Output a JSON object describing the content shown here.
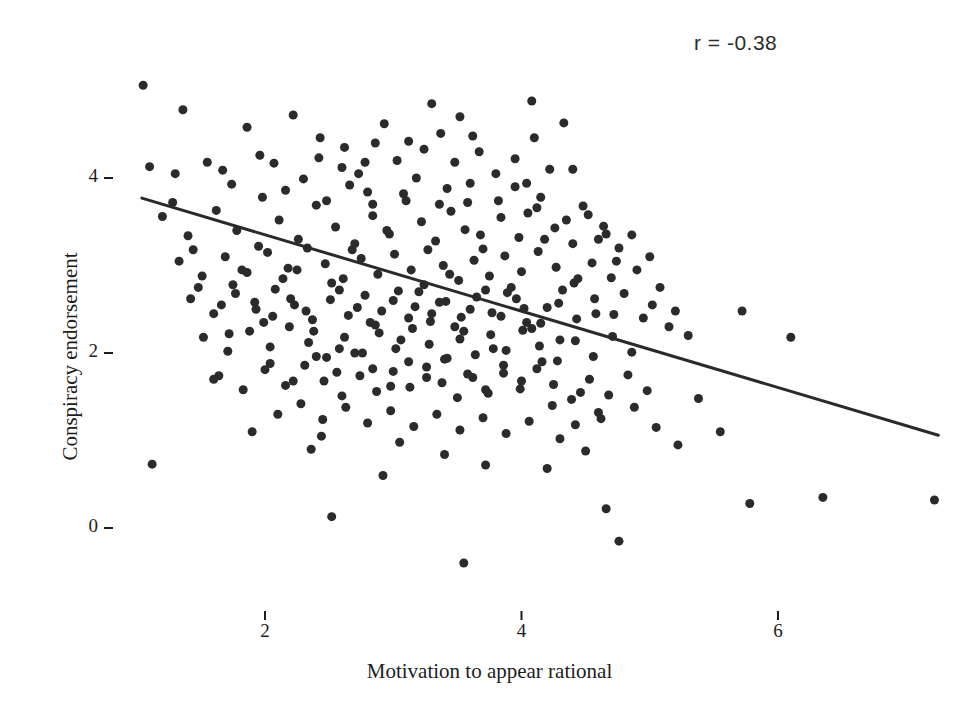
{
  "chart_data": {
    "type": "scatter",
    "title": "",
    "xlabel": "Motivation to appear rational",
    "ylabel": "Conspiracy endorsement",
    "annotation": "r =  -0.38",
    "correlation": -0.38,
    "grid": false,
    "legend": "none",
    "xlim": [
      0.75,
      7.35
    ],
    "ylim": [
      -0.75,
      5.25
    ],
    "xticks": [
      2,
      4,
      6
    ],
    "xtick_labels": [
      "2",
      "4",
      "6"
    ],
    "yticks": [
      0,
      2,
      4
    ],
    "ytick_labels": [
      "0",
      "2",
      "4"
    ],
    "marker": {
      "shape": "circle",
      "color": "#2b2b2b",
      "diameter_px": 9
    },
    "trendline": {
      "type": "linear-fit",
      "color": "#2a2a2a",
      "width_px": 3,
      "x_start": 1.04,
      "y_start": 3.77,
      "x_end": 7.25,
      "y_end": 1.06
    },
    "points": [
      [
        1.05,
        5.06
      ],
      [
        1.36,
        4.78
      ],
      [
        1.86,
        4.58
      ],
      [
        2.22,
        4.72
      ],
      [
        2.43,
        4.46
      ],
      [
        1.96,
        4.26
      ],
      [
        2.6,
        4.12
      ],
      [
        2.93,
        4.62
      ],
      [
        3.24,
        4.33
      ],
      [
        3.18,
        4.0
      ],
      [
        1.1,
        4.13
      ],
      [
        1.3,
        4.05
      ],
      [
        1.67,
        4.09
      ],
      [
        1.74,
        3.93
      ],
      [
        2.07,
        4.17
      ],
      [
        2.3,
        3.99
      ],
      [
        2.42,
        4.23
      ],
      [
        2.73,
        4.05
      ],
      [
        2.8,
        3.84
      ],
      [
        3.03,
        4.2
      ],
      [
        3.37,
        4.51
      ],
      [
        3.52,
        4.7
      ],
      [
        3.67,
        4.3
      ],
      [
        3.8,
        4.05
      ],
      [
        3.95,
        4.22
      ],
      [
        4.1,
        4.46
      ],
      [
        4.22,
        4.1
      ],
      [
        4.33,
        4.63
      ],
      [
        3.42,
        3.88
      ],
      [
        3.58,
        3.72
      ],
      [
        1.2,
        3.56
      ],
      [
        1.4,
        3.34
      ],
      [
        1.62,
        3.63
      ],
      [
        1.78,
        3.4
      ],
      [
        1.95,
        3.22
      ],
      [
        2.11,
        3.52
      ],
      [
        2.26,
        3.3
      ],
      [
        2.4,
        3.69
      ],
      [
        2.55,
        3.44
      ],
      [
        2.68,
        3.18
      ],
      [
        2.84,
        3.57
      ],
      [
        2.97,
        3.36
      ],
      [
        3.1,
        3.74
      ],
      [
        3.22,
        3.5
      ],
      [
        3.33,
        3.28
      ],
      [
        3.45,
        3.62
      ],
      [
        3.56,
        3.41
      ],
      [
        3.7,
        3.19
      ],
      [
        3.84,
        3.55
      ],
      [
        3.98,
        3.32
      ],
      [
        4.12,
        3.66
      ],
      [
        4.26,
        3.43
      ],
      [
        4.4,
        3.25
      ],
      [
        4.52,
        3.58
      ],
      [
        4.66,
        3.36
      ],
      [
        1.33,
        3.05
      ],
      [
        1.51,
        2.88
      ],
      [
        1.69,
        3.1
      ],
      [
        1.86,
        2.92
      ],
      [
        2.02,
        3.15
      ],
      [
        2.18,
        2.97
      ],
      [
        2.33,
        3.2
      ],
      [
        2.47,
        3.02
      ],
      [
        2.61,
        2.85
      ],
      [
        2.75,
        3.08
      ],
      [
        2.88,
        2.9
      ],
      [
        3.01,
        3.13
      ],
      [
        3.14,
        2.95
      ],
      [
        3.27,
        3.18
      ],
      [
        3.39,
        3.0
      ],
      [
        3.51,
        2.83
      ],
      [
        3.63,
        3.06
      ],
      [
        3.75,
        2.88
      ],
      [
        3.87,
        3.11
      ],
      [
        4.0,
        2.93
      ],
      [
        4.13,
        3.16
      ],
      [
        4.27,
        2.98
      ],
      [
        4.41,
        2.8
      ],
      [
        4.55,
        3.03
      ],
      [
        4.7,
        2.86
      ],
      [
        1.42,
        2.62
      ],
      [
        1.6,
        2.45
      ],
      [
        1.77,
        2.68
      ],
      [
        1.93,
        2.5
      ],
      [
        2.08,
        2.73
      ],
      [
        2.23,
        2.55
      ],
      [
        2.37,
        2.38
      ],
      [
        2.51,
        2.61
      ],
      [
        2.65,
        2.43
      ],
      [
        2.78,
        2.66
      ],
      [
        2.91,
        2.48
      ],
      [
        3.04,
        2.71
      ],
      [
        3.17,
        2.53
      ],
      [
        3.29,
        2.36
      ],
      [
        3.41,
        2.59
      ],
      [
        3.53,
        2.41
      ],
      [
        3.65,
        2.64
      ],
      [
        3.77,
        2.46
      ],
      [
        3.89,
        2.69
      ],
      [
        4.02,
        2.51
      ],
      [
        4.15,
        2.34
      ],
      [
        4.29,
        2.57
      ],
      [
        4.43,
        2.39
      ],
      [
        4.57,
        2.62
      ],
      [
        4.72,
        2.44
      ],
      [
        1.52,
        2.18
      ],
      [
        1.71,
        2.02
      ],
      [
        1.88,
        2.25
      ],
      [
        2.04,
        2.07
      ],
      [
        2.19,
        2.3
      ],
      [
        2.34,
        2.12
      ],
      [
        2.48,
        1.95
      ],
      [
        2.62,
        2.18
      ],
      [
        2.76,
        2.0
      ],
      [
        2.89,
        2.23
      ],
      [
        3.02,
        2.05
      ],
      [
        3.15,
        2.28
      ],
      [
        3.28,
        2.1
      ],
      [
        3.4,
        1.93
      ],
      [
        3.52,
        2.16
      ],
      [
        3.64,
        1.98
      ],
      [
        3.76,
        2.21
      ],
      [
        3.88,
        2.03
      ],
      [
        4.01,
        2.26
      ],
      [
        4.14,
        2.08
      ],
      [
        4.28,
        1.91
      ],
      [
        4.42,
        2.14
      ],
      [
        4.56,
        1.96
      ],
      [
        4.71,
        2.19
      ],
      [
        4.86,
        2.01
      ],
      [
        1.64,
        1.74
      ],
      [
        1.83,
        1.58
      ],
      [
        2.0,
        1.81
      ],
      [
        2.16,
        1.63
      ],
      [
        2.31,
        1.86
      ],
      [
        2.46,
        1.68
      ],
      [
        2.6,
        1.51
      ],
      [
        2.74,
        1.74
      ],
      [
        2.87,
        1.56
      ],
      [
        3.0,
        1.79
      ],
      [
        3.13,
        1.61
      ],
      [
        3.26,
        1.84
      ],
      [
        3.38,
        1.66
      ],
      [
        3.5,
        1.49
      ],
      [
        3.62,
        1.72
      ],
      [
        3.74,
        1.54
      ],
      [
        3.86,
        1.77
      ],
      [
        3.99,
        1.59
      ],
      [
        4.12,
        1.82
      ],
      [
        4.25,
        1.64
      ],
      [
        4.39,
        1.47
      ],
      [
        4.53,
        1.7
      ],
      [
        4.68,
        1.52
      ],
      [
        4.83,
        1.75
      ],
      [
        4.98,
        1.57
      ],
      [
        2.1,
        1.3
      ],
      [
        2.28,
        1.42
      ],
      [
        2.45,
        1.24
      ],
      [
        2.63,
        1.38
      ],
      [
        2.8,
        1.2
      ],
      [
        2.98,
        1.34
      ],
      [
        3.16,
        1.16
      ],
      [
        3.34,
        1.3
      ],
      [
        3.52,
        1.12
      ],
      [
        3.7,
        1.26
      ],
      [
        3.88,
        1.08
      ],
      [
        4.06,
        1.22
      ],
      [
        4.24,
        1.4
      ],
      [
        4.42,
        1.18
      ],
      [
        4.6,
        1.32
      ],
      [
        2.25,
        2.95
      ],
      [
        2.52,
        2.8
      ],
      [
        2.7,
        3.25
      ],
      [
        2.95,
        3.4
      ],
      [
        3.2,
        2.7
      ],
      [
        3.44,
        2.9
      ],
      [
        3.68,
        3.35
      ],
      [
        3.92,
        2.75
      ],
      [
        4.18,
        3.3
      ],
      [
        4.44,
        2.85
      ],
      [
        2.38,
        2.25
      ],
      [
        2.58,
        2.05
      ],
      [
        2.82,
        2.35
      ],
      [
        3.06,
        2.15
      ],
      [
        3.3,
        2.45
      ],
      [
        3.55,
        2.25
      ],
      [
        3.78,
        2.05
      ],
      [
        4.04,
        2.35
      ],
      [
        4.3,
        2.15
      ],
      [
        4.58,
        2.45
      ],
      [
        1.48,
        2.75
      ],
      [
        1.66,
        2.55
      ],
      [
        1.82,
        2.95
      ],
      [
        1.99,
        2.35
      ],
      [
        2.14,
        2.85
      ],
      [
        4.76,
        3.2
      ],
      [
        4.9,
        2.95
      ],
      [
        5.02,
        2.55
      ],
      [
        5.15,
        2.3
      ],
      [
        4.64,
        3.45
      ],
      [
        4.8,
        2.68
      ],
      [
        4.95,
        2.4
      ],
      [
        5.08,
        2.75
      ],
      [
        5.2,
        2.48
      ],
      [
        5.3,
        2.2
      ],
      [
        1.9,
        1.1
      ],
      [
        2.36,
        0.9
      ],
      [
        3.05,
        0.98
      ],
      [
        3.4,
        0.84
      ],
      [
        2.52,
        0.13
      ],
      [
        3.55,
        -0.4
      ],
      [
        4.66,
        0.22
      ],
      [
        4.76,
        -0.15
      ],
      [
        4.5,
        0.88
      ],
      [
        4.3,
        1.02
      ],
      [
        1.12,
        0.73
      ],
      [
        2.44,
        1.05
      ],
      [
        4.88,
        1.38
      ],
      [
        5.05,
        1.15
      ],
      [
        5.22,
        0.95
      ],
      [
        5.38,
        1.48
      ],
      [
        5.55,
        1.1
      ],
      [
        5.78,
        0.28
      ],
      [
        6.35,
        0.35
      ],
      [
        7.22,
        0.32
      ],
      [
        5.72,
        2.48
      ],
      [
        6.1,
        2.18
      ],
      [
        4.08,
        4.88
      ],
      [
        3.3,
        4.85
      ],
      [
        2.86,
        4.4
      ],
      [
        1.55,
        4.18
      ],
      [
        1.28,
        3.72
      ],
      [
        1.44,
        3.18
      ],
      [
        1.72,
        2.22
      ],
      [
        1.6,
        1.7
      ],
      [
        2.92,
        0.6
      ],
      [
        3.72,
        0.72
      ],
      [
        4.2,
        0.68
      ],
      [
        4.46,
        1.55
      ],
      [
        4.62,
        1.25
      ],
      [
        3.95,
        3.9
      ],
      [
        4.05,
        3.6
      ],
      [
        4.15,
        3.78
      ],
      [
        4.35,
        3.52
      ],
      [
        4.48,
        3.68
      ],
      [
        4.6,
        3.3
      ],
      [
        4.74,
        3.05
      ],
      [
        4.86,
        3.35
      ],
      [
        5.0,
        3.1
      ],
      [
        4.4,
        4.1
      ],
      [
        2.62,
        4.35
      ],
      [
        2.78,
        4.18
      ],
      [
        3.12,
        4.42
      ],
      [
        3.48,
        4.18
      ],
      [
        3.62,
        4.48
      ],
      [
        1.98,
        3.78
      ],
      [
        2.16,
        3.86
      ],
      [
        2.48,
        3.74
      ],
      [
        2.66,
        3.92
      ],
      [
        2.84,
        3.7
      ],
      [
        3.08,
        3.82
      ],
      [
        3.36,
        3.7
      ],
      [
        3.6,
        3.94
      ],
      [
        3.82,
        3.74
      ],
      [
        4.04,
        3.94
      ],
      [
        1.75,
        2.78
      ],
      [
        1.92,
        2.58
      ],
      [
        2.06,
        2.42
      ],
      [
        2.2,
        2.62
      ],
      [
        2.32,
        2.48
      ],
      [
        2.58,
        2.72
      ],
      [
        2.72,
        2.52
      ],
      [
        2.86,
        2.32
      ],
      [
        3.0,
        2.6
      ],
      [
        3.12,
        2.4
      ],
      [
        3.24,
        2.78
      ],
      [
        3.36,
        2.58
      ],
      [
        3.48,
        2.3
      ],
      [
        3.6,
        2.5
      ],
      [
        3.72,
        2.72
      ],
      [
        3.84,
        2.42
      ],
      [
        3.96,
        2.62
      ],
      [
        4.08,
        2.28
      ],
      [
        4.2,
        2.52
      ],
      [
        4.32,
        2.72
      ],
      [
        2.04,
        1.88
      ],
      [
        2.22,
        1.68
      ],
      [
        2.4,
        1.96
      ],
      [
        2.56,
        1.78
      ],
      [
        2.7,
        2.0
      ],
      [
        2.84,
        1.82
      ],
      [
        2.98,
        1.62
      ],
      [
        3.12,
        1.9
      ],
      [
        3.26,
        1.72
      ],
      [
        3.42,
        1.94
      ],
      [
        3.58,
        1.76
      ],
      [
        3.72,
        1.58
      ],
      [
        3.86,
        1.86
      ],
      [
        4.0,
        1.68
      ],
      [
        4.16,
        1.9
      ]
    ]
  }
}
